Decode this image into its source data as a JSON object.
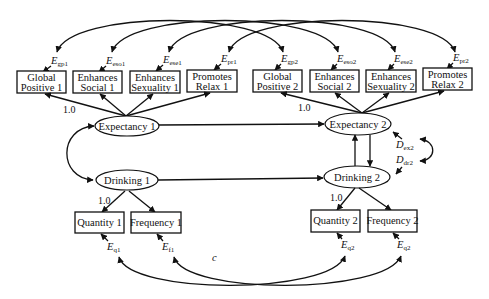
{
  "diagram": {
    "type": "structural-equation-path-diagram",
    "indicators_time1": [
      {
        "id": "gp1",
        "line1": "Global",
        "line2": "Positive 1",
        "error": "E",
        "error_sub": "gp1"
      },
      {
        "id": "eso1",
        "line1": "Enhances",
        "line2": "Social 1",
        "error": "E",
        "error_sub": "eso1"
      },
      {
        "id": "ese1",
        "line1": "Enhances",
        "line2": "Sexuality 1",
        "error": "E",
        "error_sub": "ese1"
      },
      {
        "id": "pr1",
        "line1": "Promotes",
        "line2": "Relax 1",
        "error": "E",
        "error_sub": "pr1"
      }
    ],
    "indicators_time2": [
      {
        "id": "gp2",
        "line1": "Global",
        "line2": "Positive 2",
        "error": "E",
        "error_sub": "gp2"
      },
      {
        "id": "eso2",
        "line1": "Enhances",
        "line2": "Social 2",
        "error": "E",
        "error_sub": "eso2"
      },
      {
        "id": "ese2",
        "line1": "Enhances",
        "line2": "Sexuality 2",
        "error": "E",
        "error_sub": "ese2"
      },
      {
        "id": "pr2",
        "line1": "Promotes",
        "line2": "Relax 2",
        "error": "E",
        "error_sub": "pr2"
      }
    ],
    "latents": {
      "expectancy1": "Expectancy 1",
      "drinking1": "Drinking 1",
      "expectancy2": "Expectancy 2",
      "drinking2": "Drinking 2"
    },
    "drinking_indicators": [
      {
        "id": "q1",
        "label": "Quantity 1",
        "error": "E",
        "error_sub": "q1"
      },
      {
        "id": "f1",
        "label": "Frequency 1",
        "error": "E",
        "error_sub": "f1"
      },
      {
        "id": "q2",
        "label": "Quantity 2",
        "error": "E",
        "error_sub": "q2"
      },
      {
        "id": "f2",
        "label": "Frequency 2",
        "error": "E",
        "error_sub": "q2"
      }
    ],
    "disturbances": [
      {
        "id": "dex2",
        "label": "D",
        "sub": "ex2"
      },
      {
        "id": "ddr2",
        "label": "D",
        "sub": "dr2"
      }
    ],
    "fixed_loadings": {
      "exp1": "1.0",
      "exp2": "1.0",
      "dr1": "1.0",
      "dr2": "1.0"
    },
    "stray_mark": "c"
  }
}
